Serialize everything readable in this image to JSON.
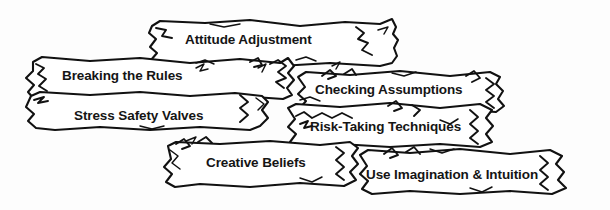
{
  "figure": {
    "name": "stone-wall-diagram",
    "background_color": "#fdfdfd",
    "stone_fill_color": "#ffffff",
    "outline_color": "#111111",
    "text_color": "#151515"
  },
  "stones": [
    {
      "id": "attitude-adjustment",
      "label": "Attitude Adjustment",
      "row": 1,
      "x": 185,
      "y": 33
    },
    {
      "id": "breaking-the-rules",
      "label": "Breaking the Rules",
      "row": 2,
      "x": 62,
      "y": 69
    },
    {
      "id": "checking-assumptions",
      "label": "Checking Assumptions",
      "row": 2,
      "x": 315,
      "y": 83
    },
    {
      "id": "stress-safety-valves",
      "label": "Stress Safety Valves",
      "row": 3,
      "x": 74,
      "y": 109
    },
    {
      "id": "risk-taking-techniques",
      "label": "Risk-Taking Techniques",
      "row": 3,
      "x": 310,
      "y": 120
    },
    {
      "id": "creative-beliefs",
      "label": "Creative Beliefs",
      "row": 4,
      "x": 206,
      "y": 156
    },
    {
      "id": "use-imagination-intuition",
      "label": "Use Imagination & Intuition",
      "row": 4,
      "x": 366,
      "y": 168
    }
  ]
}
